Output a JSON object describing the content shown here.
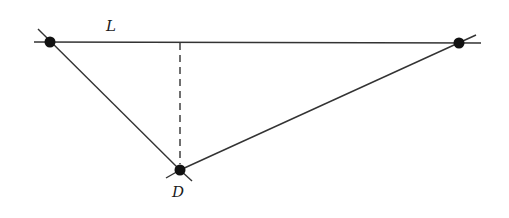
{
  "diagram": {
    "line_label": "L",
    "point_label": "D",
    "points": {
      "left": {
        "x": 50,
        "y": 42
      },
      "right": {
        "x": 459,
        "y": 43
      },
      "D": {
        "x": 180,
        "y": 170
      }
    },
    "colors": {
      "stroke": "#222222",
      "point": "#111111",
      "background": "#ffffff"
    }
  }
}
